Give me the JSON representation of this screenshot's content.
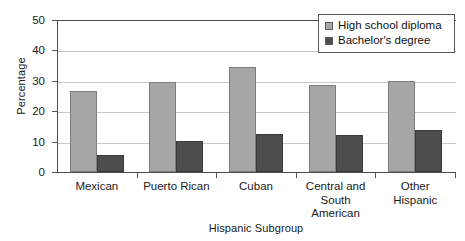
{
  "chart_data": {
    "type": "bar",
    "title": "",
    "subtitle": "",
    "xlabel": "Hispanic Subgroup",
    "ylabel": "Percentage",
    "categories": [
      "Mexican",
      "Puerto Rican",
      "Cuban",
      "Central and\nSouth\nAmerican",
      "Other\nHispanic"
    ],
    "series": [
      {
        "name": "High school diploma",
        "color": "#a6a6a6",
        "values": [
          26.7,
          29.5,
          34.7,
          28.6,
          29.9
        ]
      },
      {
        "name": "Bachelor's degree",
        "color": "#4d4d4d",
        "values": [
          5.5,
          10.3,
          12.4,
          12.2,
          13.8
        ]
      }
    ],
    "ylim": [
      0,
      50
    ],
    "ytick_values": [
      0,
      10,
      20,
      30,
      40,
      50
    ],
    "ytick_labels": [
      "0",
      "10",
      "20",
      "30",
      "40",
      "50"
    ],
    "grid": true,
    "grid_axis": "y",
    "legend_position": "top-right",
    "legend_border": true,
    "background_color": "#ffffff",
    "axis_color": "#4d4d4d",
    "gridline_color": "#c8c8c8"
  }
}
